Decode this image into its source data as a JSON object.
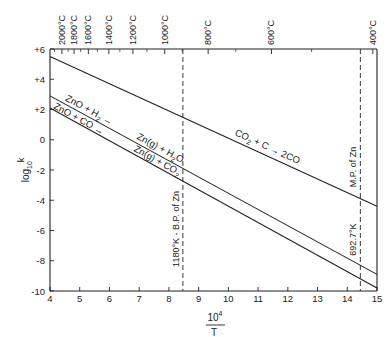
{
  "chart_data": {
    "type": "line",
    "title": "",
    "xlabel": "10^4 / T",
    "xlabel_numerator": "10",
    "xlabel_exponent": "4",
    "xlabel_denominator": "T",
    "ylabel": "log10 k",
    "ylabel_main": "log",
    "ylabel_sub": "10",
    "ylabel_tail": "k",
    "xlim": [
      4,
      15
    ],
    "ylim": [
      -10,
      6
    ],
    "grid": false,
    "x_ticks": [
      4,
      5,
      6,
      7,
      8,
      9,
      10,
      11,
      12,
      13,
      14,
      15
    ],
    "x_tick_labels": [
      "4",
      "5",
      "6",
      "7",
      "8",
      "9",
      "10",
      "11",
      "12",
      "13",
      "14",
      "15"
    ],
    "y_ticks": [
      6,
      4,
      2,
      0,
      -2,
      -4,
      -6,
      -8,
      -10
    ],
    "y_tick_labels": [
      "+6",
      "+4",
      "+2",
      "0",
      "-2",
      "-4",
      "-6",
      "-8",
      "-10"
    ],
    "top_axis": {
      "label_unit": "°C",
      "ticks": [
        {
          "label": "2000°C",
          "x": 4.4
        },
        {
          "label": "1800°C",
          "x": 4.81
        },
        {
          "label": "1600°C",
          "x": 5.29
        },
        {
          "label": "1400°C",
          "x": 5.98
        },
        {
          "label": "1200°C",
          "x": 6.79
        },
        {
          "label": "1000°C",
          "x": 7.86
        },
        {
          "label": "800°C",
          "x": 9.32
        },
        {
          "label": "600°C",
          "x": 11.45
        },
        {
          "label": "400°C",
          "x": 14.86
        }
      ],
      "minor_ticks": [
        4.15,
        4.61,
        5.03,
        5.59,
        6.35,
        7.26,
        8.45,
        10.25,
        12.8
      ]
    },
    "series": [
      {
        "name": "CO2 + C → 2CO",
        "label_parts": [
          "CO",
          "2",
          " + C ",
          "→",
          " 2CO"
        ],
        "x": [
          4,
          15
        ],
        "y": [
          5.5,
          -4.4
        ]
      },
      {
        "name": "ZnO + H2 → Zn(g) + H2O",
        "label_parts_left": [
          "ZnO + H",
          "2",
          " →"
        ],
        "label_parts_right": [
          "Zn(g) + H",
          "2",
          "O"
        ],
        "x": [
          4,
          15
        ],
        "y": [
          2.9,
          -8.9
        ]
      },
      {
        "name": "ZnO + CO → Zn(g) + CO2",
        "label_parts_left": [
          "ZnO + CO →"
        ],
        "label_parts_right": [
          "Zn(g) + CO",
          "2"
        ],
        "x": [
          4,
          15
        ],
        "y": [
          2.1,
          -9.8
        ]
      }
    ],
    "annotations": [
      {
        "type": "vline",
        "x": 8.47,
        "style": "dashed",
        "text": "1180°K - B.P. of Zn"
      },
      {
        "type": "vline",
        "x": 14.44,
        "style": "dashed",
        "text_top": "M.P. of Zn",
        "text_bottom": "692.7°K"
      }
    ]
  }
}
